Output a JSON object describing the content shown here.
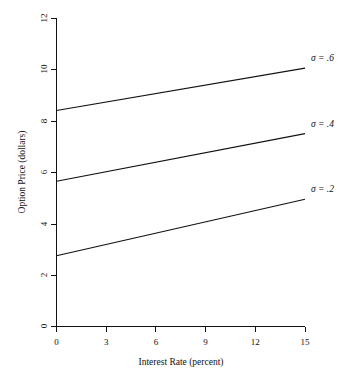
{
  "chart_data": {
    "type": "line",
    "title": "",
    "xlabel": "Interest Rate (percent)",
    "ylabel": "Option Price (dollars)",
    "xlim": [
      0,
      15
    ],
    "ylim": [
      0,
      12
    ],
    "xticks": [
      0,
      3,
      6,
      9,
      12,
      15
    ],
    "xtick_labels": [
      "0",
      "3",
      "6",
      "9",
      "12",
      "15"
    ],
    "yticks": [
      0,
      2,
      4,
      6,
      8,
      10,
      12
    ],
    "ytick_labels": [
      "0",
      "2",
      "4",
      "6",
      "8",
      "10",
      "12"
    ],
    "grid": false,
    "legend_position": "right-inline-annotations",
    "x": [
      0,
      15
    ],
    "series": [
      {
        "name": "sigma = .6",
        "label": "σ = .6",
        "values": [
          8.4,
          10.05
        ],
        "color": "#111111"
      },
      {
        "name": "sigma = .4",
        "label": "σ = .4",
        "values": [
          5.65,
          7.5
        ],
        "color": "#111111"
      },
      {
        "name": "sigma = .2",
        "label": "σ = .2",
        "values": [
          2.75,
          4.95
        ],
        "color": "#111111"
      }
    ],
    "annotations": [
      {
        "text": "σ = .6",
        "x": 15,
        "y": 10.05
      },
      {
        "text": "σ = .4",
        "x": 15,
        "y": 7.5
      },
      {
        "text": "σ = .2",
        "x": 15,
        "y": 4.95
      }
    ]
  },
  "axes": {
    "x_title": "Interest Rate (percent)",
    "y_title": "Option Price (dollars)",
    "x_tick_labels": [
      "0",
      "3",
      "6",
      "9",
      "12",
      "15"
    ],
    "y_tick_labels": [
      "0",
      "2",
      "4",
      "6",
      "8",
      "10",
      "12"
    ]
  },
  "labels": {
    "sigma_06": "σ = .6",
    "sigma_04": "σ = .4",
    "sigma_02": "σ = .2"
  },
  "colors": {
    "background": "#ffffff",
    "ink": "#111111"
  }
}
